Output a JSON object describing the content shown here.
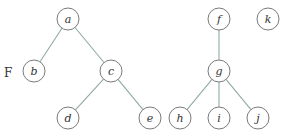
{
  "title_label": "F",
  "colors": {
    "edge": "#8fa9a9",
    "node_stroke": "#7a7a7a",
    "text": "#333333"
  },
  "nodes": [
    {
      "id": "a",
      "label": "a",
      "x": 68,
      "y": 19
    },
    {
      "id": "b",
      "label": "b",
      "x": 34,
      "y": 71
    },
    {
      "id": "c",
      "label": "c",
      "x": 111,
      "y": 71
    },
    {
      "id": "d",
      "label": "d",
      "x": 68,
      "y": 118
    },
    {
      "id": "e",
      "label": "e",
      "x": 150,
      "y": 118
    },
    {
      "id": "f",
      "label": "f",
      "x": 219,
      "y": 19
    },
    {
      "id": "g",
      "label": "g",
      "x": 219,
      "y": 71
    },
    {
      "id": "h",
      "label": "h",
      "x": 180,
      "y": 118
    },
    {
      "id": "i",
      "label": "i",
      "x": 219,
      "y": 118
    },
    {
      "id": "j",
      "label": "j",
      "x": 258,
      "y": 118
    },
    {
      "id": "k",
      "label": "k",
      "x": 268,
      "y": 19
    }
  ],
  "edges": [
    [
      "a",
      "b"
    ],
    [
      "a",
      "c"
    ],
    [
      "c",
      "d"
    ],
    [
      "c",
      "e"
    ],
    [
      "f",
      "g"
    ],
    [
      "g",
      "h"
    ],
    [
      "g",
      "i"
    ],
    [
      "g",
      "j"
    ]
  ]
}
